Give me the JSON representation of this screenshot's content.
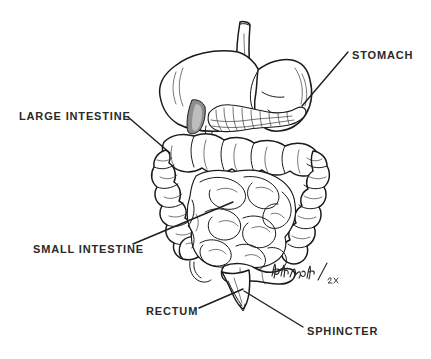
{
  "figure": {
    "kind": "anatomical-line-drawing",
    "background_color": "#ffffff",
    "ink_color": "#1a1a1a",
    "label_color": "#2a2a2a",
    "shade_color": "#8e8e8e",
    "width": 431,
    "height": 359
  },
  "labels": [
    {
      "id": "stomach",
      "text": "STOMACH",
      "text_x": 352,
      "text_y": 59,
      "anchor": "start",
      "leader": "M348,52 L302,106"
    },
    {
      "id": "large-intestine",
      "text": "LARGE  INTESTINE",
      "text_x": 19,
      "text_y": 120,
      "anchor": "start",
      "leader": "M128,117 L170,153"
    },
    {
      "id": "small-intestine",
      "text": "SMALL  INTESTINE",
      "text_x": 33,
      "text_y": 253,
      "anchor": "start",
      "leader": "M133,244 L233,202"
    },
    {
      "id": "rectum",
      "text": "RECTUM",
      "text_x": 146,
      "text_y": 315,
      "anchor": "start",
      "leader": "M199,308 L243,289"
    },
    {
      "id": "sphincter",
      "text": "SPHINCTER",
      "text_x": 307,
      "text_y": 335,
      "anchor": "start",
      "leader": "M303,327 L244,291"
    }
  ],
  "signature": {
    "present": true,
    "description": "artist cursive signature with /2x beneath",
    "x": 272,
    "y": 272
  },
  "parts": [
    {
      "id": "esophagus",
      "name": "esophagus"
    },
    {
      "id": "stomach-body",
      "name": "stomach"
    },
    {
      "id": "pancreas",
      "name": "pancreas"
    },
    {
      "id": "duodenum",
      "name": "duodenum"
    },
    {
      "id": "transverse-colon",
      "name": "transverse colon"
    },
    {
      "id": "ascending-colon",
      "name": "ascending colon"
    },
    {
      "id": "descending-colon",
      "name": "descending colon"
    },
    {
      "id": "cecum",
      "name": "cecum"
    },
    {
      "id": "appendix",
      "name": "appendix"
    },
    {
      "id": "small-intestine-coils",
      "name": "small intestine coils"
    },
    {
      "id": "sigmoid",
      "name": "sigmoid colon"
    },
    {
      "id": "rectum-funnel",
      "name": "rectum"
    },
    {
      "id": "sphincter-tip",
      "name": "sphincter"
    }
  ]
}
